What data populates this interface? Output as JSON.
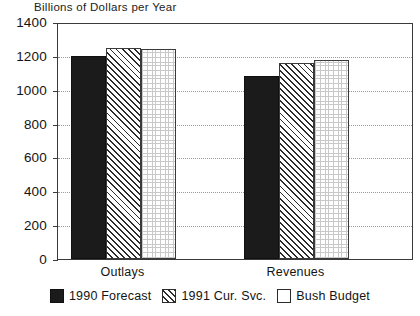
{
  "chart_data": {
    "type": "bar",
    "title": "Billions of Dollars per Year",
    "xlabel": "",
    "ylabel": "",
    "ylim": [
      0,
      1400
    ],
    "yticks": [
      0,
      200,
      400,
      600,
      800,
      1000,
      1200,
      1400
    ],
    "ytick_labels": [
      "0",
      "200",
      "400",
      "600",
      "800",
      "1000",
      "1200",
      "1400"
    ],
    "grid": true,
    "grid_axis": "y",
    "legend_position": "bottom",
    "categories": [
      "Outlays",
      "Revenues"
    ],
    "series": [
      {
        "name": "1990 Forecast",
        "pattern": "solid",
        "color": "#1b1b1b",
        "values": [
          1197,
          1080
        ]
      },
      {
        "name": "1991 Cur. Svc.",
        "pattern": "hatch",
        "color": "#ffffff",
        "values": [
          1245,
          1160
        ]
      },
      {
        "name": "Bush Budget",
        "pattern": "dots",
        "color": "#ffffff",
        "values": [
          1240,
          1175
        ]
      }
    ]
  },
  "legend": {
    "entries": [
      {
        "label": "1990 Forecast",
        "swatch": "solid"
      },
      {
        "label": "1991 Cur. Svc.",
        "swatch": "hatch"
      },
      {
        "label": "Bush Budget",
        "swatch": "dots"
      }
    ]
  },
  "colors": {
    "series_1": "#1b1b1b",
    "series_2": "#ffffff",
    "series_3": "#ffffff",
    "axis": "#3a3a3a",
    "grid": "#9a9a9a",
    "text": "#141414",
    "background": "#ffffff"
  }
}
